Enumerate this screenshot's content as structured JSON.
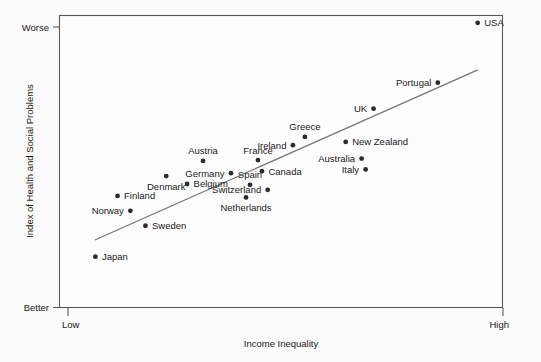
{
  "chart_data": {
    "type": "scatter",
    "title": "",
    "xlabel": "Income Inequality",
    "ylabel": "Index of Health and Social Problems",
    "x_tick_labels": [
      "Low",
      "High"
    ],
    "y_tick_labels": [
      "Worse",
      "Better"
    ],
    "y_tick_order": "worse-top-better-bottom",
    "grid": false,
    "legend": false,
    "xlim": [
      0,
      1
    ],
    "ylim": [
      0,
      1
    ],
    "axis_note": "Axes are qualitative: x from Low to High income inequality, y from Better (bottom) to Worse (top).",
    "points": [
      {
        "label": "USA",
        "x": 0.944,
        "y": 0.975,
        "label_pos": "right"
      },
      {
        "label": "Portugal",
        "x": 0.854,
        "y": 0.77,
        "label_pos": "left"
      },
      {
        "label": "UK",
        "x": 0.709,
        "y": 0.681,
        "label_pos": "left"
      },
      {
        "label": "Greece",
        "x": 0.554,
        "y": 0.584,
        "label_pos": "above"
      },
      {
        "label": "Ireland",
        "x": 0.527,
        "y": 0.556,
        "label_pos": "left"
      },
      {
        "label": "New Zealand",
        "x": 0.646,
        "y": 0.567,
        "label_pos": "right"
      },
      {
        "label": "Australia",
        "x": 0.682,
        "y": 0.51,
        "label_pos": "left"
      },
      {
        "label": "Italy",
        "x": 0.691,
        "y": 0.473,
        "label_pos": "left"
      },
      {
        "label": "France",
        "x": 0.448,
        "y": 0.505,
        "label_pos": "above"
      },
      {
        "label": "Austria",
        "x": 0.324,
        "y": 0.502,
        "label_pos": "above"
      },
      {
        "label": "Canada",
        "x": 0.457,
        "y": 0.467,
        "label_pos": "right"
      },
      {
        "label": "Germany",
        "x": 0.387,
        "y": 0.46,
        "label_pos": "left"
      },
      {
        "label": "Denmark",
        "x": 0.241,
        "y": 0.45,
        "label_pos": "below"
      },
      {
        "label": "Belgium",
        "x": 0.288,
        "y": 0.423,
        "label_pos": "right"
      },
      {
        "label": "Spain",
        "x": 0.43,
        "y": 0.42,
        "label_pos": "above"
      },
      {
        "label": "Switzerland",
        "x": 0.47,
        "y": 0.403,
        "label_pos": "left"
      },
      {
        "label": "Netherlands",
        "x": 0.421,
        "y": 0.377,
        "label_pos": "below"
      },
      {
        "label": "Finland",
        "x": 0.131,
        "y": 0.382,
        "label_pos": "right"
      },
      {
        "label": "Norway",
        "x": 0.16,
        "y": 0.331,
        "label_pos": "left"
      },
      {
        "label": "Sweden",
        "x": 0.194,
        "y": 0.28,
        "label_pos": "right"
      },
      {
        "label": "Japan",
        "x": 0.081,
        "y": 0.174,
        "label_pos": "right"
      }
    ],
    "trend_line": {
      "x_start": 0.081,
      "y_start": 0.232,
      "x_end": 0.943,
      "y_end": 0.813
    }
  },
  "colors": {
    "background": "#fbfbfb",
    "plot_area": "#fdfdfd",
    "frame": "#595959",
    "dot": "#2b2b2b",
    "trend_line": "#777777",
    "text": "#1a1a1a"
  }
}
